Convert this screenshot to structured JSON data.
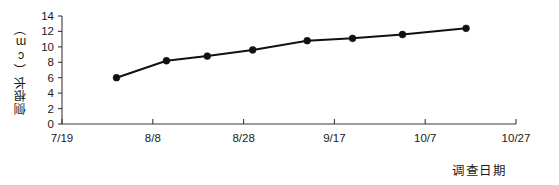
{
  "chart_data": {
    "type": "line",
    "title": "",
    "xlabel": "调查日期",
    "ylabel": "侧根长（cm）",
    "grid": false,
    "legend": null,
    "legend_position": "none",
    "xticklabels": [
      "7/19",
      "8/8",
      "8/28",
      "9/17",
      "10/7",
      "10/27"
    ],
    "yticklabels": [
      "0",
      "2",
      "4",
      "6",
      "8",
      "10",
      "12",
      "14"
    ],
    "ylim": [
      0,
      14
    ],
    "ytick_step": 2,
    "xlim_labels": [
      "7/19",
      "10/27"
    ],
    "x": [
      "7/31",
      "8/11",
      "8/20",
      "8/30",
      "9/11",
      "9/21",
      "10/2",
      "10/16"
    ],
    "values": [
      6.0,
      8.2,
      8.8,
      9.6,
      10.8,
      11.1,
      11.6,
      12.4
    ],
    "series": [
      {
        "name": "侧根长",
        "values": [
          6.0,
          8.2,
          8.8,
          9.6,
          10.8,
          11.1,
          11.6,
          12.4
        ],
        "color": "#111111",
        "marker": "circle"
      }
    ]
  },
  "axis": {
    "y_title": "侧根长（cm）",
    "x_title": "调查日期"
  },
  "style": {
    "line_color": "#111111",
    "axis_color": "#3a3a3a",
    "text_color": "#1a1a1a",
    "background": "#ffffff"
  }
}
